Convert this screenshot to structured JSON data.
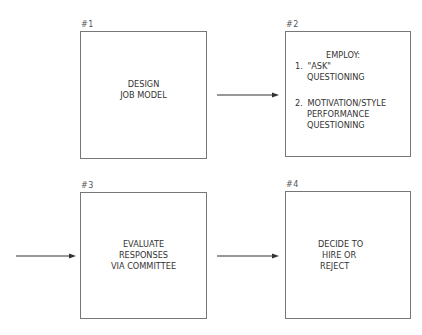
{
  "diagram": {
    "boxes": [
      {
        "id": "#1",
        "lines": [
          "DESIGN",
          "JOB MODEL"
        ]
      },
      {
        "id": "#2",
        "title": "EMPLOY:",
        "items": [
          {
            "num": "1.",
            "lines": [
              "\"ASK\"",
              "QUESTIONING"
            ]
          },
          {
            "num": "2.",
            "lines": [
              "MOTIVATION/STYLE",
              "PERFORMANCE",
              "QUESTIONING"
            ]
          }
        ]
      },
      {
        "id": "#3",
        "lines": [
          "EVALUATE",
          "RESPONSES",
          "VIA COMMITTEE"
        ]
      },
      {
        "id": "#4",
        "lines": [
          "DECIDE TO",
          "HIRE OR",
          "REJECT"
        ]
      }
    ],
    "arrows": [
      {
        "from": "#1",
        "to": "#2"
      },
      {
        "from": "left-edge",
        "to": "#3"
      },
      {
        "from": "#3",
        "to": "#4"
      }
    ],
    "colors": {
      "stroke": "#777777",
      "arrow": "#333333",
      "text": "#333333"
    }
  }
}
